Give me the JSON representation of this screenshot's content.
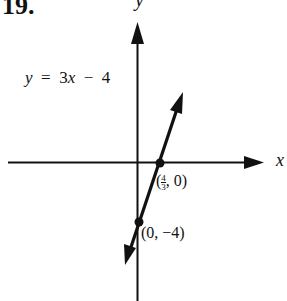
{
  "problem_number": "19.",
  "axes": {
    "x_label": "x",
    "y_label": "y"
  },
  "equation": {
    "lhs": "y",
    "equals": "=",
    "rhs_coef": "3",
    "rhs_var": "x",
    "rhs_op": "−",
    "rhs_const": "4",
    "full": "y = 3x − 4"
  },
  "points": [
    {
      "label": "(4/3, 0)",
      "open": "(",
      "num": "4",
      "den": "3",
      "rest": ", 0)",
      "x": 1.3333,
      "y": 0,
      "type": "x-intercept"
    },
    {
      "label": "(0, −4)",
      "text": "(0, −4)",
      "x": 0,
      "y": -4,
      "type": "y-intercept"
    }
  ],
  "line": {
    "slope": 3,
    "intercept": -4,
    "color": "#111111"
  }
}
